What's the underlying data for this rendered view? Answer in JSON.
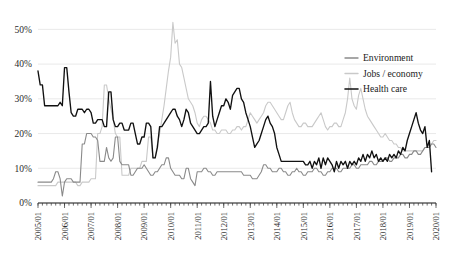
{
  "chart_data": {
    "type": "line",
    "title": "",
    "xlabel": "",
    "ylabel": "",
    "ylim": [
      0,
      55
    ],
    "ytick_values": [
      0,
      10,
      20,
      30,
      40,
      50
    ],
    "ytick_labels": [
      "0%",
      "10%",
      "20%",
      "30%",
      "40%",
      "50%"
    ],
    "grid": true,
    "legend_position": "top-right",
    "x_start": "2005/01",
    "x_end": "2020/01",
    "x_interval": "monthly",
    "xtick_labels": [
      "2005/01",
      "2006/01",
      "2007/01",
      "2008/01",
      "2009/01",
      "2010/01",
      "2011/01",
      "2012/01",
      "2013/01",
      "2014/01",
      "2015/01",
      "2016/01",
      "2017/01",
      "2018/01",
      "2019/01",
      "2020/01"
    ],
    "series": [
      {
        "name": "Environment",
        "color": "#8a8a8a",
        "width": 1.1,
        "values": [
          6,
          6,
          6,
          6,
          6,
          6,
          6,
          7,
          9,
          9,
          7,
          2,
          6,
          7,
          7,
          7,
          6,
          6,
          6,
          6,
          17,
          17,
          20,
          20,
          20,
          19,
          19,
          18,
          12,
          12,
          12,
          16,
          13,
          12,
          13,
          19,
          19,
          12,
          11,
          11,
          11,
          11,
          8,
          8,
          9,
          10,
          10,
          10,
          11,
          10,
          9,
          8,
          8,
          9,
          9,
          10,
          11,
          11,
          13,
          13,
          10,
          9,
          8,
          8,
          8,
          7,
          7,
          10,
          10,
          7,
          6,
          5,
          9,
          9,
          9,
          10,
          10,
          9,
          9,
          8,
          8,
          9,
          9,
          9,
          9,
          9,
          9,
          9,
          9,
          9,
          9,
          9,
          9,
          8,
          8,
          8,
          8,
          7,
          7,
          7,
          8,
          9,
          11,
          11,
          10,
          10,
          9,
          9,
          9,
          10,
          10,
          9,
          9,
          8,
          8,
          9,
          9,
          10,
          9,
          9,
          8,
          8,
          9,
          9,
          9,
          10,
          10,
          9,
          9,
          8,
          8,
          9,
          9,
          10,
          10,
          10,
          9,
          9,
          10,
          10,
          10,
          10,
          11,
          11,
          10,
          10,
          11,
          11,
          11,
          11,
          12,
          12,
          11,
          11,
          12,
          12,
          12,
          13,
          13,
          12,
          12,
          13,
          13,
          13,
          14,
          14,
          13,
          13,
          14,
          14,
          15,
          15,
          14,
          14,
          15,
          16,
          16,
          16,
          17,
          17,
          16
        ]
      },
      {
        "name": "Jobs / economy",
        "color": "#c9c9c9",
        "width": 1.1,
        "values": [
          5,
          5,
          5,
          5,
          5,
          5,
          5,
          5,
          5,
          6,
          6,
          6,
          6,
          6,
          6,
          6,
          6,
          6,
          5,
          5,
          6,
          6,
          6,
          6,
          7,
          7,
          7,
          20,
          20,
          22,
          34,
          34,
          30,
          27,
          24,
          20,
          19,
          19,
          8,
          8,
          8,
          8,
          10,
          10,
          10,
          10,
          10,
          12,
          12,
          12,
          19,
          19,
          13,
          13,
          17,
          20,
          24,
          28,
          33,
          38,
          42,
          52,
          46,
          47,
          40,
          39,
          36,
          33,
          30,
          29,
          28,
          26,
          23,
          22,
          24,
          25,
          25,
          24,
          23,
          21,
          21,
          20,
          20,
          21,
          21,
          21,
          20,
          20,
          21,
          21,
          22,
          22,
          21,
          22,
          22,
          24,
          26,
          25,
          24,
          23,
          24,
          25,
          26,
          28,
          29,
          29,
          28,
          27,
          26,
          25,
          24,
          24,
          26,
          28,
          29,
          26,
          24,
          23,
          22,
          22,
          23,
          23,
          22,
          22,
          22,
          23,
          24,
          25,
          26,
          24,
          22,
          21,
          22,
          22,
          23,
          23,
          22,
          22,
          24,
          26,
          30,
          36,
          30,
          28,
          27,
          31,
          33,
          30,
          27,
          25,
          24,
          23,
          22,
          21,
          20,
          19,
          19,
          20,
          19,
          18,
          18,
          17,
          17,
          16,
          16,
          15,
          15,
          15,
          15,
          15,
          15,
          15,
          15,
          15,
          15,
          16,
          16,
          17,
          17,
          18,
          18
        ]
      },
      {
        "name": "Health care",
        "color": "#111111",
        "width": 1.35,
        "values": [
          38,
          34,
          34,
          28,
          28,
          28,
          28,
          28,
          28,
          28,
          29,
          28,
          39,
          39,
          32,
          26,
          25,
          25,
          27,
          27,
          27,
          26,
          27,
          27,
          26,
          23,
          23,
          24,
          24,
          24,
          22,
          22,
          32,
          32,
          24,
          22,
          22,
          23,
          23,
          21,
          21,
          21,
          23,
          23,
          20,
          17,
          17,
          19,
          19,
          23,
          23,
          22,
          13,
          13,
          16,
          22,
          22,
          23,
          24,
          25,
          26,
          27,
          27,
          25,
          24,
          22,
          24,
          27,
          26,
          23,
          22,
          21,
          20,
          20,
          21,
          22,
          22,
          23,
          35,
          25,
          22,
          24,
          26,
          28,
          28,
          30,
          29,
          27,
          31,
          32,
          33,
          33,
          30,
          29,
          26,
          24,
          22,
          19,
          16,
          17,
          18,
          20,
          22,
          24,
          25,
          23,
          22,
          20,
          16,
          14,
          12,
          12,
          12,
          12,
          12,
          12,
          12,
          12,
          12,
          12,
          12,
          11,
          11,
          12,
          10,
          12,
          11,
          13,
          10,
          13,
          11,
          13,
          12,
          11,
          9,
          12,
          10,
          12,
          11,
          12,
          10,
          12,
          11,
          12,
          11,
          13,
          12,
          14,
          12,
          14,
          13,
          15,
          13,
          14,
          12,
          13,
          12,
          13,
          12,
          14,
          13,
          14,
          13,
          15,
          14,
          16,
          15,
          18,
          20,
          22,
          24,
          26,
          23,
          21,
          20,
          22,
          16,
          18,
          9
        ]
      }
    ]
  },
  "legend": {
    "items": [
      {
        "label": "Environment"
      },
      {
        "label": "Jobs / economy"
      },
      {
        "label": "Health care"
      }
    ]
  }
}
